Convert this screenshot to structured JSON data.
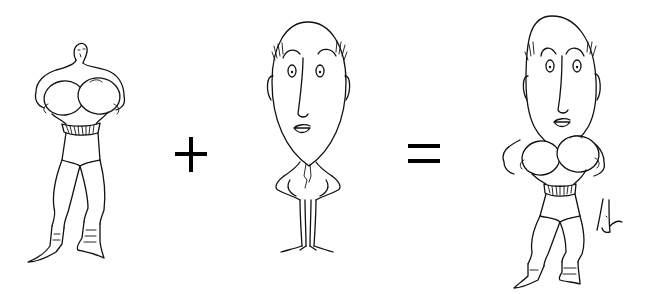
{
  "illustration": {
    "style": "single-line ink caricature",
    "background_color": "#ffffff",
    "ink_color": "#111111",
    "equation": {
      "left_term": "boxer-body",
      "operator_1": "+",
      "middle_term": "egg-headed-man",
      "operator_2": "=",
      "result": "egg-headed-boxer"
    },
    "figures": [
      {
        "id": "boxer",
        "description": "Small-headed boxer with oversized gloves held at chest, belted trunks, laced boots"
      },
      {
        "id": "egghead",
        "description": "Man with huge egg-shaped head, tufts of hair, hands on hips, thin legs"
      },
      {
        "id": "combined",
        "description": "Egg-headed boxer combining the large head with the boxer's body"
      }
    ],
    "signature": "artist-signature"
  }
}
